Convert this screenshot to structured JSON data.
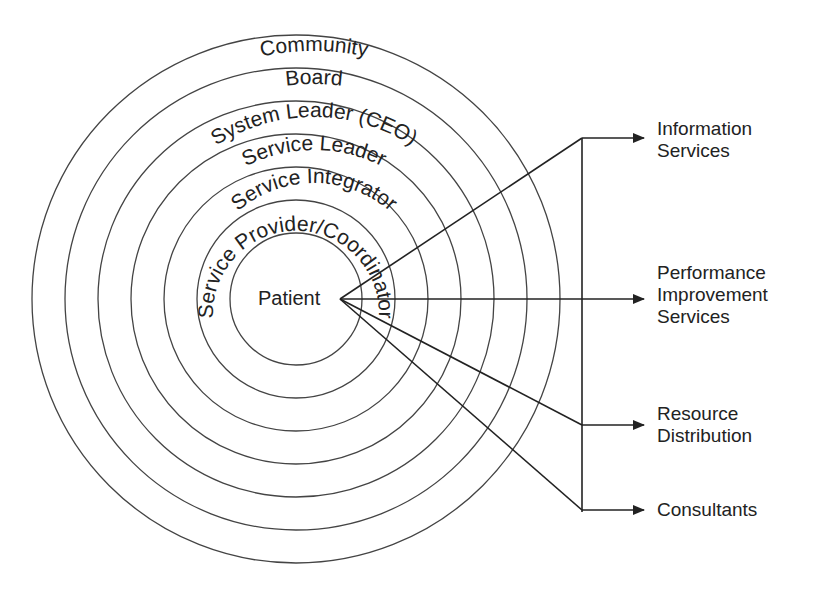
{
  "diagram": {
    "center_label": "Patient",
    "rings": [
      {
        "label": "Community",
        "r": 264
      },
      {
        "label": "Board",
        "r": 231
      },
      {
        "label": "System Leader (CEO)",
        "r": 198
      },
      {
        "label": "Service Leader",
        "r": 165
      },
      {
        "label": "Service Integrator",
        "r": 132
      },
      {
        "label": "Service Provider/Coordinator",
        "r": 99
      },
      {
        "label": "",
        "r": 66
      }
    ],
    "outputs": [
      {
        "label": "Information\nServices"
      },
      {
        "label": "Performance\nImprovement\nServices"
      },
      {
        "label": "Resource\nDistribution"
      },
      {
        "label": "Consultants"
      }
    ],
    "colors": {
      "line": "#222222",
      "ring": "#444444",
      "background": "#ffffff"
    }
  }
}
